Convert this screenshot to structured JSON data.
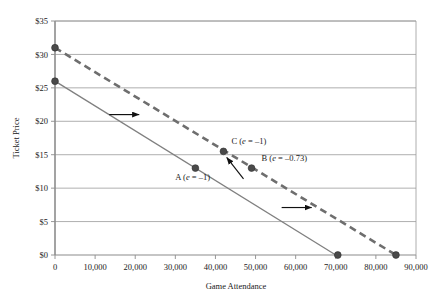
{
  "chart_data": {
    "type": "line",
    "title": "",
    "xlabel": "Game Attendance",
    "ylabel": "Ticket Price",
    "xlim": [
      0,
      90000
    ],
    "ylim": [
      0,
      35
    ],
    "xticks": [
      0,
      10000,
      20000,
      30000,
      40000,
      50000,
      60000,
      70000,
      80000,
      90000
    ],
    "xticklabels": [
      "0",
      "10,000",
      "20,000",
      "30,000",
      "40,000",
      "50,000",
      "60,000",
      "70,000",
      "80,000",
      "90,000"
    ],
    "yticks": [
      0,
      5,
      10,
      15,
      20,
      25,
      30,
      35
    ],
    "yticklabels": [
      "$0",
      "$5",
      "$10",
      "$15",
      "$20",
      "$25",
      "$30",
      "$35"
    ],
    "grid": "horizontal",
    "legend": "none",
    "series": [
      {
        "name": "original-demand",
        "style": "solid",
        "color": "#808080",
        "points": [
          [
            0,
            26
          ],
          [
            70000,
            0
          ]
        ]
      },
      {
        "name": "shifted-demand",
        "style": "dashed",
        "color": "#6e6e6e",
        "points": [
          [
            0,
            31
          ],
          [
            85000,
            0
          ]
        ]
      }
    ],
    "markers": [
      {
        "name": "solid-intercept",
        "x": 0,
        "y": 26
      },
      {
        "name": "dashed-intercept",
        "x": 0,
        "y": 31
      },
      {
        "name": "point-A",
        "x": 35000,
        "y": 13
      },
      {
        "name": "point-B",
        "x": 49000,
        "y": 13
      },
      {
        "name": "point-C",
        "x": 42000,
        "y": 15.5
      },
      {
        "name": "solid-x-intercept",
        "x": 70500,
        "y": 0
      },
      {
        "name": "dashed-x-intercept",
        "x": 85000,
        "y": 0
      }
    ],
    "annotations": [
      {
        "name": "label-A",
        "prefix": "A (",
        "ital": "e",
        "suffix": " = –1)",
        "x": 30000,
        "y": 11.2
      },
      {
        "name": "label-B",
        "prefix": "B (",
        "ital": "e",
        "suffix": " = –0.73)",
        "x": 51500,
        "y": 14.1
      },
      {
        "name": "label-C",
        "prefix": "C (",
        "ital": "e",
        "suffix": " = –1)",
        "x": 44000,
        "y": 16.6
      }
    ],
    "arrows": [
      {
        "name": "shift-arrow-upper",
        "x1": 13500,
        "y1": 21,
        "x2": 21000,
        "y2": 21
      },
      {
        "name": "shift-arrow-lower",
        "x1": 56500,
        "y1": 7.1,
        "x2": 64000,
        "y2": 7.1
      },
      {
        "name": "movement-arrow-B-to-C",
        "x1": 47000,
        "y1": 11.4,
        "x2": 42800,
        "y2": 14.6
      }
    ]
  },
  "colors": {
    "grid": "#9a9a9a",
    "axis": "#8c8c8c",
    "solid_line": "#808080",
    "dashed_line": "#6e6e6e",
    "marker": "#4a4a4a",
    "arrow": "#111111",
    "text": "#1a1a1a",
    "background": "#ffffff"
  }
}
